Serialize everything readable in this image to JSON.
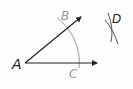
{
  "diagram": {
    "type": "geometric-construction",
    "points": {
      "A": {
        "label": "A",
        "x": 25,
        "y": 63,
        "color": "#222222"
      },
      "B": {
        "label": "B",
        "x": 66,
        "y": 16,
        "color": "#9a9a9a"
      },
      "C": {
        "label": "C",
        "x": 74,
        "y": 74,
        "color": "#9a9a9a"
      },
      "D": {
        "label": "D",
        "x": 117,
        "y": 20,
        "color": "#222222"
      }
    },
    "rays": [
      {
        "name": "ray-AB",
        "from": [
          25,
          63
        ],
        "to": [
          81,
          17
        ],
        "color": "#222222"
      },
      {
        "name": "ray-AC",
        "from": [
          25,
          63
        ],
        "to": [
          97,
          63
        ],
        "color": "#222222"
      }
    ],
    "arcs": [
      {
        "name": "arc-BC",
        "center": "A",
        "color": "#9a9a9a"
      },
      {
        "name": "arc-D-1",
        "color": "#444444"
      },
      {
        "name": "arc-D-2",
        "color": "#444444"
      }
    ],
    "colors": {
      "ink": "#222222",
      "construction": "#9a9a9a",
      "background": "#fdfdfd"
    }
  }
}
